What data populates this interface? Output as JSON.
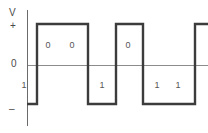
{
  "figure": {
    "type": "signal-waveform",
    "encoding_name": "NRZ-L",
    "background_color": "#ffffff",
    "signal_color": "#3c3c3c",
    "axis_color": "#6b6b6b",
    "zero_line_color": "#8c8c8c",
    "text_color": "#555555"
  },
  "axis": {
    "y_axis_title": "V",
    "plus_label": "+",
    "zero_label": "0",
    "minus_label": "–",
    "y_axis_x_px": 27,
    "y_axis_top_px": 10,
    "y_axis_bottom_px": 126,
    "zero_line_y_px": 65,
    "high_level_y_px": 24,
    "low_level_y_px": 104,
    "plot_right_px": 208
  },
  "chart_data": {
    "type": "line",
    "title": "",
    "xlabel": "",
    "ylabel": "V",
    "ytick_labels": [
      "+",
      "0",
      "–"
    ],
    "grid": false,
    "legend": null,
    "levels": {
      "high": "+",
      "zero": "0",
      "low": "–"
    },
    "bit_sequence": [
      "1",
      "0",
      "0",
      "1",
      "0",
      "1",
      "1"
    ],
    "bits": [
      {
        "value": "1",
        "level": "low",
        "x_start": 27,
        "x_end": 37,
        "label_x": 24,
        "label_y": 81,
        "show_label": true
      },
      {
        "value": "0",
        "level": "high",
        "x_start": 37,
        "x_end": 63,
        "label_x": 48,
        "label_y": 41,
        "show_label": true
      },
      {
        "value": "0",
        "level": "high",
        "x_start": 63,
        "x_end": 88,
        "label_x": 72,
        "label_y": 41,
        "show_label": true
      },
      {
        "value": "1",
        "level": "low",
        "x_start": 88,
        "x_end": 116,
        "label_x": 102,
        "label_y": 81,
        "show_label": true
      },
      {
        "value": "0",
        "level": "high",
        "x_start": 116,
        "x_end": 143,
        "label_x": 128,
        "label_y": 41,
        "show_label": true
      },
      {
        "value": "1",
        "level": "low",
        "x_start": 143,
        "x_end": 169,
        "label_x": 157,
        "label_y": 81,
        "show_label": true
      },
      {
        "value": "1",
        "level": "low",
        "x_start": 169,
        "x_end": 195,
        "label_x": 178,
        "label_y": 81,
        "show_label": true
      },
      {
        "value": "",
        "level": "high",
        "x_start": 195,
        "x_end": 208,
        "label_x": 0,
        "label_y": 0,
        "show_label": false
      }
    ],
    "transitions_x": [
      37,
      88,
      116,
      143,
      195
    ]
  }
}
